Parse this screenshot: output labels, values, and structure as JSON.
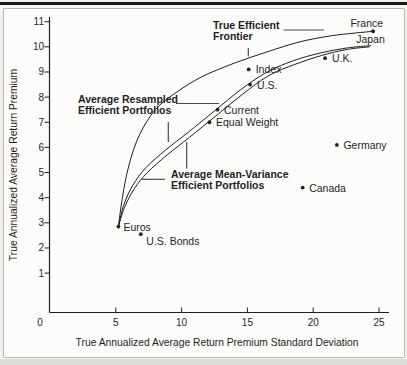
{
  "page": {
    "ink": "#1f1f1f",
    "background": "#f3f2ef",
    "box_background": "#fcfcfa",
    "box_border": "#b7b5b1",
    "top_rule_color": "#161616"
  },
  "chart_data": {
    "type": "scatter",
    "title": "",
    "xlabel": "True Annualized Average Return Premium Standard Deviation",
    "ylabel": "True Annualized Average Return Premium",
    "xlim": [
      0,
      25
    ],
    "ylim": [
      0,
      11
    ],
    "x_ticks": [
      0,
      5,
      10,
      15,
      20,
      25
    ],
    "y_ticks": [
      1,
      2,
      3,
      4,
      5,
      6,
      7,
      8,
      9,
      10,
      11
    ],
    "grid": false,
    "legend": "none (labels annotated on chart)",
    "series": [
      {
        "name": "True Efficient Frontier",
        "points": [
          [
            5.2,
            2.85
          ],
          [
            5.5,
            4.0
          ],
          [
            6.0,
            5.3
          ],
          [
            6.8,
            6.5
          ],
          [
            8.0,
            7.5
          ],
          [
            9.5,
            8.15
          ],
          [
            11.5,
            8.8
          ],
          [
            14.0,
            9.35
          ],
          [
            16.5,
            9.8
          ],
          [
            19.0,
            10.2
          ],
          [
            21.5,
            10.45
          ],
          [
            24.55,
            10.62
          ]
        ]
      },
      {
        "name": "Average Resampled Efficient Portfolios",
        "points": [
          [
            5.2,
            2.85
          ],
          [
            5.6,
            3.7
          ],
          [
            6.3,
            4.5
          ],
          [
            7.3,
            5.2
          ],
          [
            8.8,
            5.9
          ],
          [
            10.5,
            6.6
          ],
          [
            12.5,
            7.45
          ],
          [
            14.5,
            8.3
          ],
          [
            16.5,
            9.0
          ],
          [
            18.5,
            9.45
          ],
          [
            20.5,
            9.75
          ],
          [
            22.5,
            9.95
          ],
          [
            24.4,
            10.05
          ]
        ]
      },
      {
        "name": "Average Mean-Variance Efficient Portfolios",
        "points": [
          [
            5.2,
            2.85
          ],
          [
            5.65,
            3.6
          ],
          [
            6.4,
            4.35
          ],
          [
            7.4,
            5.0
          ],
          [
            8.9,
            5.7
          ],
          [
            10.6,
            6.4
          ],
          [
            12.6,
            7.25
          ],
          [
            14.6,
            8.1
          ],
          [
            16.6,
            8.85
          ],
          [
            18.6,
            9.3
          ],
          [
            20.6,
            9.65
          ],
          [
            22.6,
            9.9
          ],
          [
            24.3,
            10.0
          ]
        ]
      }
    ],
    "points": [
      {
        "label": "France",
        "x": 24.55,
        "y": 10.62,
        "dot": true,
        "anchor": "end",
        "dx": 10,
        "dy": -4.5
      },
      {
        "label": "Japan",
        "x": 24.6,
        "y": 10.2,
        "dot": false,
        "anchor": "end",
        "dx": 11,
        "dy": 1
      },
      {
        "label": "U.K.",
        "x": 20.9,
        "y": 9.55,
        "dot": true,
        "anchor": "start",
        "dx": 7,
        "dy": 3.5
      },
      {
        "label": "Index",
        "x": 15.1,
        "y": 9.1,
        "dot": true,
        "anchor": "start",
        "dx": 7,
        "dy": 4
      },
      {
        "label": "U.S.",
        "x": 15.2,
        "y": 8.5,
        "dot": true,
        "anchor": "start",
        "dx": 7,
        "dy": 4
      },
      {
        "label": "Current",
        "x": 12.73,
        "y": 7.5,
        "dot": true,
        "anchor": "start",
        "dx": 6.5,
        "dy": 4
      },
      {
        "label": "Equal Weight",
        "x": 12.12,
        "y": 7.0,
        "dot": true,
        "anchor": "start",
        "dx": 6.5,
        "dy": 4
      },
      {
        "label": "Germany",
        "x": 21.8,
        "y": 6.1,
        "dot": true,
        "anchor": "start",
        "dx": 6.5,
        "dy": 4
      },
      {
        "label": "Canada",
        "x": 19.2,
        "y": 4.4,
        "dot": true,
        "anchor": "start",
        "dx": 6.5,
        "dy": 4
      },
      {
        "label": "Euros",
        "x": 5.2,
        "y": 2.85,
        "dot": true,
        "anchor": "start",
        "dx": 5,
        "dy": 4.5
      },
      {
        "label": "U.S. Bonds",
        "x": 6.9,
        "y": 2.55,
        "dot": true,
        "anchor": "start",
        "dx": 5.5,
        "dy": 11
      }
    ],
    "annotations": {
      "frontier": {
        "line1": "True Efficient",
        "line2": "Frontier"
      },
      "resampled": {
        "line1": "Average Resampled",
        "line2": "Efficient Portfolios"
      },
      "meanvar": {
        "line1": "Average Mean-Variance",
        "line2": "Efficient Portfolios"
      }
    },
    "pointer_lines": [
      {
        "x1": 283.5,
        "y1": 30,
        "x2": 324,
        "y2": 30
      },
      {
        "x1": 248.3,
        "y1": 48,
        "x2": 248.3,
        "y2": 56.5
      },
      {
        "x1": 176,
        "y1": 103.5,
        "x2": 219,
        "y2": 103.5
      },
      {
        "x1": 168.3,
        "y1": 122,
        "x2": 168.3,
        "y2": 142
      },
      {
        "x1": 186.7,
        "y1": 142,
        "x2": 186.7,
        "y2": 168.5
      },
      {
        "x1": 141.7,
        "y1": 179.3,
        "x2": 165,
        "y2": 179.3
      }
    ]
  }
}
